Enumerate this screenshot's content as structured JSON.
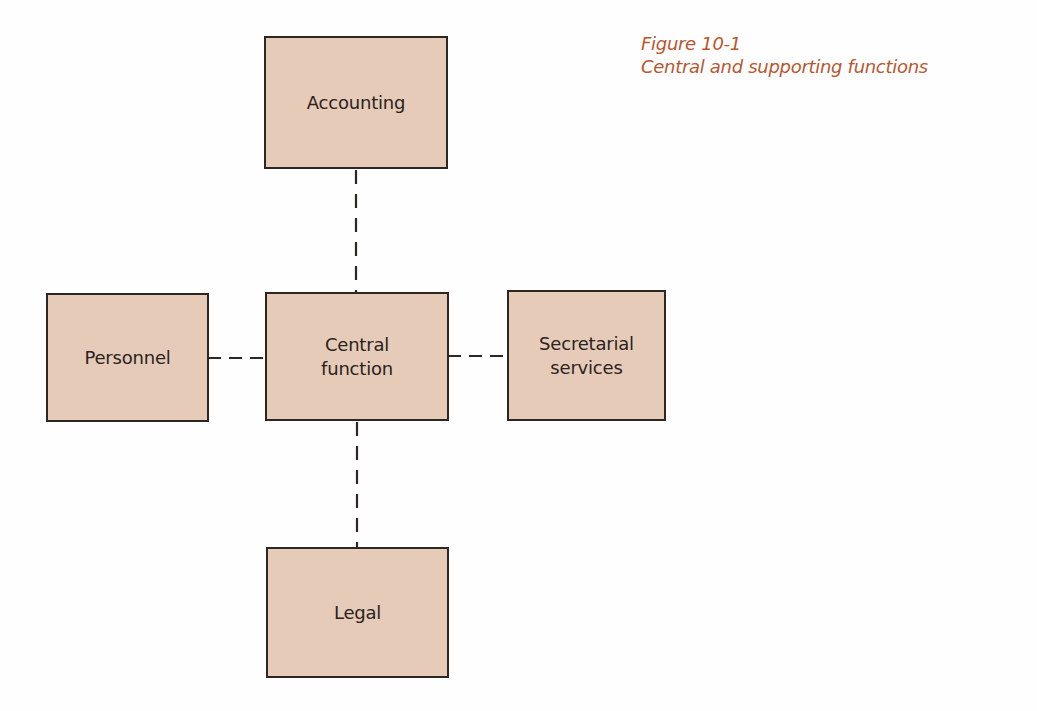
{
  "caption": {
    "figure_number": "Figure 10-1",
    "title": "Central and supporting functions"
  },
  "colors": {
    "box_fill": "#e6cbb8",
    "box_border": "#2e2622",
    "caption_text": "#b8562e",
    "connector": "#2e2622"
  },
  "nodes": {
    "accounting": {
      "label": "Accounting"
    },
    "central": {
      "line1": "Central",
      "line2": "function"
    },
    "personnel": {
      "label": "Personnel"
    },
    "secretarial": {
      "line1": "Secretarial",
      "line2": "services"
    },
    "legal": {
      "label": "Legal"
    }
  },
  "edges": [
    {
      "from": "central",
      "to": "accounting",
      "style": "dashed"
    },
    {
      "from": "central",
      "to": "personnel",
      "style": "dashed"
    },
    {
      "from": "central",
      "to": "secretarial",
      "style": "dashed"
    },
    {
      "from": "central",
      "to": "legal",
      "style": "dashed"
    }
  ]
}
